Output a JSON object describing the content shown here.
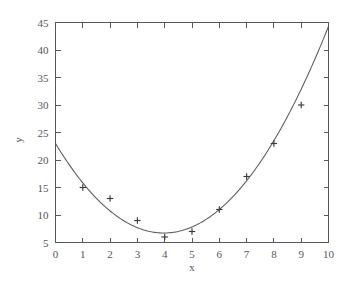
{
  "chart_data": {
    "type": "scatter",
    "title": "",
    "subtitle": "",
    "xlabel": "x",
    "ylabel": "y",
    "xlim": [
      0,
      10
    ],
    "ylim": [
      5,
      45
    ],
    "grid": false,
    "legend": false,
    "legend_position": "none",
    "xticks": [
      0,
      1,
      2,
      3,
      4,
      5,
      6,
      7,
      8,
      9,
      10
    ],
    "xtick_labels": [
      "0",
      "1",
      "2",
      "3",
      "4",
      "5",
      "6",
      "7",
      "8",
      "9",
      "10"
    ],
    "yticks": [
      5,
      10,
      15,
      20,
      25,
      30,
      35,
      40,
      45
    ],
    "ytick_labels": [
      "5",
      "10",
      "15",
      "20",
      "25",
      "30",
      "35",
      "40",
      "45"
    ],
    "marker_style": "plus",
    "marker_color": "#3a3a3e",
    "line_color": "#5a595e",
    "series": [
      {
        "name": "data points",
        "type": "scatter",
        "x": [
          1,
          2,
          3,
          4,
          5,
          6,
          7,
          8,
          9
        ],
        "y": [
          15,
          13,
          9,
          6,
          7,
          11,
          17,
          23,
          30
        ]
      },
      {
        "name": "quadratic fit",
        "type": "line",
        "equation": "y = 1.033x^2 - 8.2x + 23",
        "coefficients": [
          1.033,
          -8.2,
          23
        ],
        "x_start": 0,
        "x_end": 10,
        "y_start": 23,
        "y_end": 40,
        "vertex_x": 3.97,
        "vertex_y": 6.73
      }
    ]
  },
  "axes": {
    "x_title": "x",
    "y_title": "y"
  },
  "colors": {
    "background": "#ffffff",
    "frame": "#58575c",
    "text": "#55545a",
    "curve": "#5a595e",
    "marker": "#3a3a3e"
  }
}
